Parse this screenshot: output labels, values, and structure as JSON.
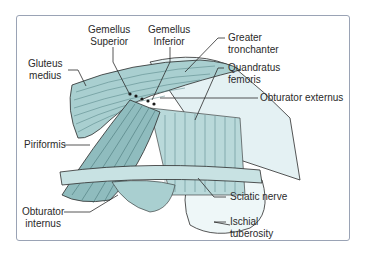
{
  "figure": {
    "colors": {
      "muscle": "#a9cfd0",
      "muscle_dark": "#7fb0b2",
      "bone": "#e4f1f3",
      "nerve": "#c8e2e3",
      "line": "#2b2b2b",
      "frame": "#9aa3b5"
    },
    "labels": {
      "gemellus_superior": [
        "Gemellus",
        "Superior"
      ],
      "gemellus_inferior": [
        "Gemellus",
        "Inferior"
      ],
      "gluteus_medius": [
        "Gluteus",
        "medius"
      ],
      "greater_trochanter": [
        "Greater",
        "tronchanter"
      ],
      "quadratus_femoris": [
        "Quandratus",
        "femoris"
      ],
      "obturator_externus": "Obturator externus",
      "piriformis": "Piriformis",
      "sciatic_nerve": "Sciatic nerve",
      "obturator_internus": [
        "Obturator",
        "internus"
      ],
      "ischial_tuberosity": [
        "Ischial",
        "tuberosity"
      ]
    }
  }
}
